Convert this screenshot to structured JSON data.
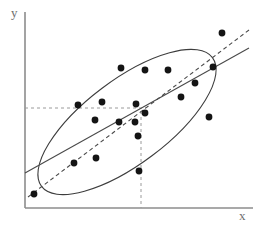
{
  "figure": {
    "type": "scatter-plot-with-regression-and-confidence-ellipse",
    "background_color": "#ffffff",
    "width": 262,
    "height": 231
  },
  "axes": {
    "x_label": "x",
    "y_label": "y",
    "axis_color": "#8c8c8c",
    "x_axis": {
      "x1": 25,
      "y1": 208,
      "x2": 253,
      "y2": 208
    },
    "y_axis": {
      "x1": 25,
      "y1": 12,
      "x2": 25,
      "y2": 208
    }
  },
  "reference_lines": {
    "color": "#9a9a9a",
    "dash": "3,3",
    "horizontal": {
      "x1": 25,
      "y1": 108,
      "x2": 146,
      "y2": 108,
      "name": "mean-y-reference"
    },
    "vertical": {
      "x1": 141,
      "y1": 111,
      "x2": 141,
      "y2": 208,
      "name": "mean-x-reference"
    }
  },
  "regression_line": {
    "name": "solid-regression-line",
    "color": "#4a4a4a",
    "width": 1.1,
    "x1": 25,
    "y1": 173,
    "x2": 249,
    "y2": 48
  },
  "major_axis_line": {
    "name": "dashed-major-axis-line",
    "color": "#4a4a4a",
    "width": 1.1,
    "dash": "4,3",
    "x1": 28,
    "y1": 197,
    "x2": 249,
    "y2": 30
  },
  "ellipse": {
    "name": "confidence-ellipse",
    "color": "#3d3d3d",
    "width": 1.1,
    "cx": 127,
    "cy": 122,
    "rx": 107,
    "ry": 42,
    "rotation_deg": -37
  },
  "chart_data": {
    "type": "scatter",
    "title": "",
    "xlabel": "x",
    "ylabel": "y",
    "grid": false,
    "legend": null,
    "point_color": "#141414",
    "point_radius": 3.4,
    "points_pixel": [
      {
        "x": 34,
        "y": 194
      },
      {
        "x": 74,
        "y": 163
      },
      {
        "x": 96,
        "y": 158
      },
      {
        "x": 78,
        "y": 105
      },
      {
        "x": 102,
        "y": 102
      },
      {
        "x": 95,
        "y": 120
      },
      {
        "x": 121,
        "y": 68
      },
      {
        "x": 145,
        "y": 70
      },
      {
        "x": 168,
        "y": 70
      },
      {
        "x": 136,
        "y": 104
      },
      {
        "x": 119,
        "y": 122
      },
      {
        "x": 135,
        "y": 122
      },
      {
        "x": 145,
        "y": 113
      },
      {
        "x": 138,
        "y": 136
      },
      {
        "x": 139,
        "y": 171
      },
      {
        "x": 181,
        "y": 97
      },
      {
        "x": 195,
        "y": 83
      },
      {
        "x": 209,
        "y": 117
      },
      {
        "x": 213,
        "y": 67
      },
      {
        "x": 222,
        "y": 33
      }
    ],
    "n_points": 20
  }
}
